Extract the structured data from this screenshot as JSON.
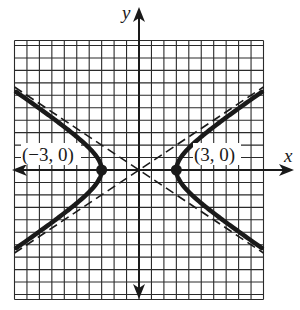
{
  "figure": {
    "type": "hyperbola-graph",
    "equation_implied": "x^2/9 - y^2/4 = 1",
    "axes": {
      "x_label": "x",
      "y_label": "y",
      "x_range": [
        -10,
        10
      ],
      "y_range": [
        -10,
        10
      ],
      "grid": true,
      "grid_step": 1
    },
    "vertices": [
      {
        "x": -3,
        "y": 0,
        "label": "(−3, 0)"
      },
      {
        "x": 3,
        "y": 0,
        "label": "(3, 0)"
      }
    ],
    "asymptotes": [
      {
        "slope": 0.6667,
        "intercept": 0,
        "style": "dashed"
      },
      {
        "slope": -0.6667,
        "intercept": 0,
        "style": "dashed"
      }
    ],
    "colors": {
      "ink": "#1a1a1a",
      "grid": "#2a2a2a",
      "background": "#ffffff"
    }
  }
}
